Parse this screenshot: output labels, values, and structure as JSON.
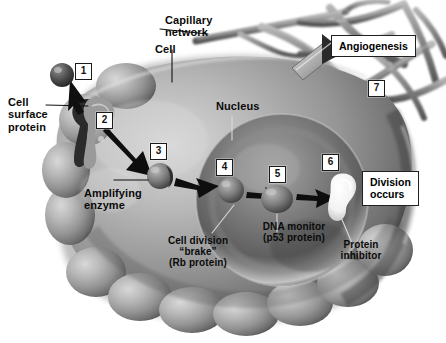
{
  "figure": {
    "background_color": "#ffffff",
    "cell_body_color": "#8c8c8c",
    "nucleus_color": "#6e6e6e",
    "capillary_color": "#7b7b7b",
    "arrow_color": "#111111",
    "box_fill": "#ffffff",
    "box_border": "#1a1a1a"
  },
  "labels": {
    "capillary_network": "Capillary\nnetwork",
    "cell": "Cell",
    "cell_surface_protein": "Cell\nsurface\nprotein",
    "nucleus": "Nucleus",
    "amplifying_enzyme": "Amplifying\nenzyme",
    "cell_division_brake": "Cell division\n“brake”\n(Rb protein)",
    "dna_monitor": "DNA monitor\n(p53 protein)",
    "protein_inhibitor": "Protein\ninhibitor"
  },
  "callouts": {
    "angiogenesis": "Angiogenesis",
    "division_occurs": "Division\noccurs"
  },
  "steps": [
    {
      "id": "1",
      "number": "1"
    },
    {
      "id": "2",
      "number": "2"
    },
    {
      "id": "3",
      "number": "3"
    },
    {
      "id": "4",
      "number": "4"
    },
    {
      "id": "5",
      "number": "5"
    },
    {
      "id": "6",
      "number": "6"
    },
    {
      "id": "7",
      "number": "7"
    }
  ]
}
